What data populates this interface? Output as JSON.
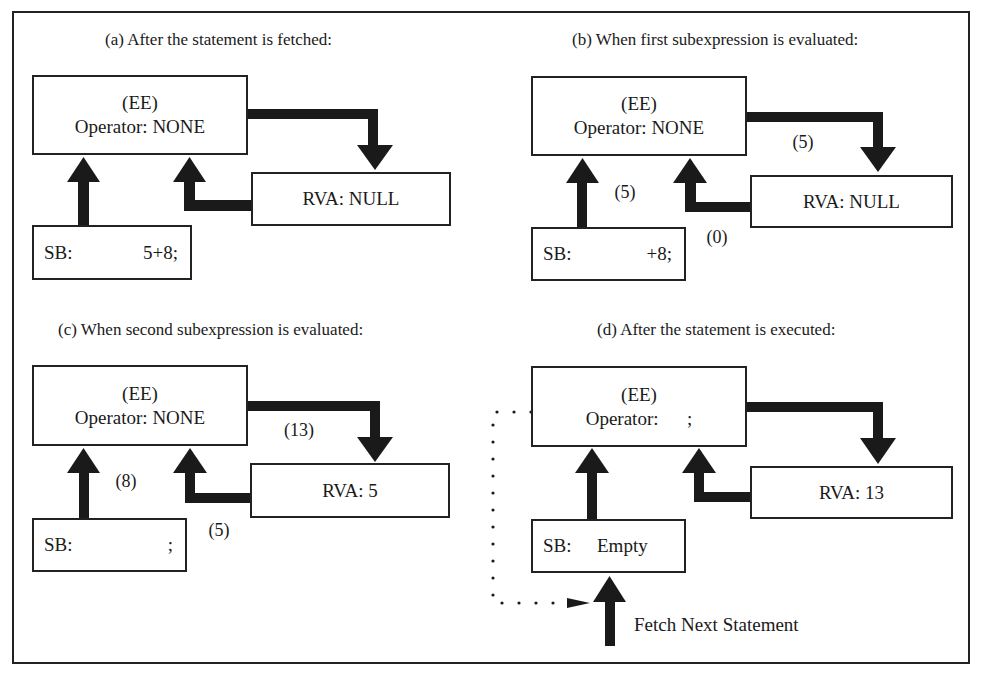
{
  "figure": {
    "panels": [
      {
        "id": "a",
        "title": "(a) After the statement is fetched:",
        "ee": {
          "label": "(EE)",
          "operator": "Operator: NONE"
        },
        "rva": "RVA: NULL",
        "sb": {
          "label": "SB:",
          "value": "5+8;"
        },
        "flow_labels": []
      },
      {
        "id": "b",
        "title": "(b) When first subexpression is evaluated:",
        "ee": {
          "label": "(EE)",
          "operator": "Operator: NONE"
        },
        "rva": "RVA: NULL",
        "sb": {
          "label": "SB:",
          "value": "+8;"
        },
        "flow_labels": [
          "(5)",
          "(5)",
          "(0)"
        ]
      },
      {
        "id": "c",
        "title": "(c) When second subexpression is evaluated:",
        "ee": {
          "label": "(EE)",
          "operator": "Operator: NONE"
        },
        "rva": "RVA: 5",
        "sb": {
          "label": "SB:",
          "value": ";"
        },
        "flow_labels": [
          "(13)",
          "(8)",
          "(5)"
        ]
      },
      {
        "id": "d",
        "title": "(d) After the statement is executed:",
        "ee": {
          "label": "(EE)",
          "operator": "Operator:      ;"
        },
        "rva": "RVA: 13",
        "sb": {
          "label": "SB:",
          "value": "Empty"
        },
        "flow_labels": [],
        "fetch_label": "Fetch Next Statement"
      }
    ],
    "colors": {
      "stroke": "#222222",
      "background": "#ffffff"
    }
  }
}
